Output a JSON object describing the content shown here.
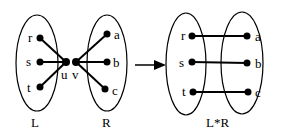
{
  "left_diagram": {
    "left_set": {
      "label": "L",
      "nodes": [
        "r",
        "s",
        "t"
      ]
    },
    "right_set": {
      "label": "R",
      "nodes": [
        "a",
        "b",
        "c"
      ]
    },
    "center_nodes": [
      "u",
      "v"
    ]
  },
  "right_diagram": {
    "label": "L*R",
    "left_nodes": [
      "r",
      "s",
      "t"
    ],
    "right_nodes": [
      "a",
      "b",
      "c"
    ]
  },
  "colors": {
    "stroke": "#000000",
    "background": "#ffffff"
  }
}
